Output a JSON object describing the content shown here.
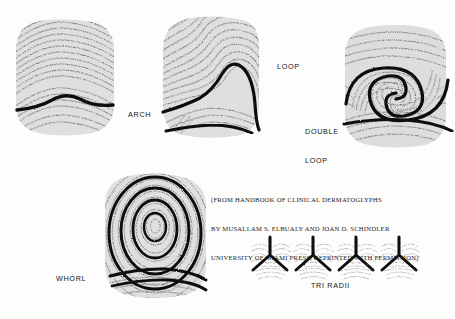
{
  "figure": {
    "kind": "fingerprint-pattern-plate",
    "background_color": "#fdfdfc",
    "ink_color": "#141414",
    "prints": [
      {
        "id": "arch",
        "label": "ARCH",
        "box": {
          "x": 16,
          "y": 20,
          "w": 99,
          "h": 116
        },
        "label_pos": {
          "x": 128,
          "y": 110
        },
        "ridge_type": "arch",
        "traced_lines": 1,
        "description": "Ridges enter one side, rise in a gentle wave and exit the other side; one heavy traced arch line across the lower third."
      },
      {
        "id": "loop",
        "label": "LOOP",
        "box": {
          "x": 162,
          "y": 16,
          "w": 98,
          "h": 122
        },
        "label_pos": {
          "x": 277,
          "y": 62
        },
        "ridge_type": "loop",
        "traced_lines": 2,
        "description": "Ridges recurve back on themselves forming a single loop with one delta; heavy traced loop and a lower traced line."
      },
      {
        "id": "double-loop",
        "label": "DOUBLE\nLOOP",
        "label_lines": [
          "DOUBLE",
          "LOOP"
        ],
        "box": {
          "x": 344,
          "y": 26,
          "w": 104,
          "h": 120
        },
        "label_pos": {
          "x": 305,
          "y": 108
        },
        "ridge_type": "double-loop",
        "traced_lines": 3,
        "description": "Two interlocking S-shaped loop cores swirling into one another, with two deltas and heavy traced spiral lines."
      },
      {
        "id": "whorl",
        "label": "WHORL",
        "box": {
          "x": 104,
          "y": 172,
          "w": 104,
          "h": 126
        },
        "label_pos": {
          "x": 56,
          "y": 274
        },
        "ridge_type": "whorl",
        "traced_lines": 5,
        "description": "Concentric closed ridges spiralling around a central core; heavy traced concentric ovals."
      }
    ],
    "tri_radii": {
      "label": "TRI RADII",
      "label_pos": {
        "x": 311,
        "y": 281
      },
      "count": 4,
      "boxes": [
        {
          "x": 250,
          "y": 237,
          "w": 41,
          "h": 42
        },
        {
          "x": 293,
          "y": 237,
          "w": 41,
          "h": 42
        },
        {
          "x": 336,
          "y": 237,
          "w": 41,
          "h": 42
        },
        {
          "x": 379,
          "y": 237,
          "w": 41,
          "h": 42
        }
      ],
      "description": "Four enlarged delta regions, each showing three ridge systems meeting at a Y-shaped triradius traced in heavy ink."
    },
    "credit": {
      "lines": [
        "(FROM HANDBOOK OF CLINICAL DERMATOGLYPHS",
        "BY MUSALLAM S. ELBUALY AND JOAN D. SCHINDLER",
        "UNIVERSITY OF MIAMI PRESS, REPRINTED WITH PERMISSION)"
      ],
      "pos": {
        "x": 211,
        "y": 176
      }
    }
  }
}
